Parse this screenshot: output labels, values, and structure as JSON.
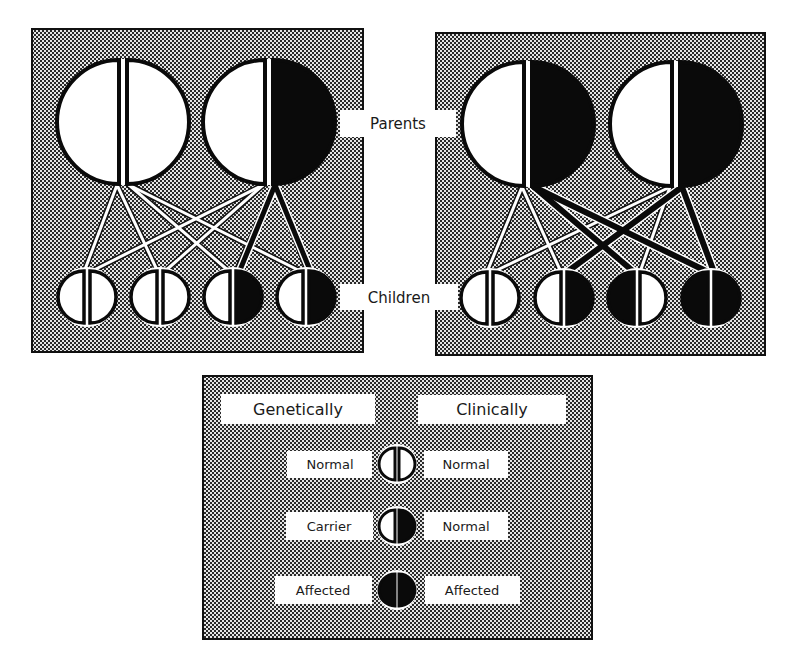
{
  "figure": {
    "title": "",
    "labels": {
      "parents": "Parents",
      "children": "Children"
    },
    "colors": {
      "background": "#ffffff",
      "panel_dot": "#1a1a1a",
      "panel_light": "#e8e8e8",
      "affected": "#0a0a0a",
      "normal": "#ffffff",
      "outline": "#0a0a0a"
    }
  },
  "panels": [
    {
      "id": "left-cross",
      "description": "Normal parent x Carrier parent",
      "parents": [
        {
          "left": "normal",
          "right": "normal",
          "label": "Normal"
        },
        {
          "left": "normal",
          "right": "affected",
          "label": "Carrier"
        }
      ],
      "children": [
        {
          "left": "normal",
          "right": "normal",
          "label": "Normal"
        },
        {
          "left": "normal",
          "right": "normal",
          "label": "Normal"
        },
        {
          "left": "normal",
          "right": "affected",
          "label": "Carrier"
        },
        {
          "left": "normal",
          "right": "affected",
          "label": "Carrier"
        }
      ]
    },
    {
      "id": "right-cross",
      "description": "Carrier parent x Carrier parent",
      "parents": [
        {
          "left": "normal",
          "right": "affected",
          "label": "Carrier"
        },
        {
          "left": "normal",
          "right": "affected",
          "label": "Carrier"
        }
      ],
      "children": [
        {
          "left": "normal",
          "right": "normal",
          "label": "Normal"
        },
        {
          "left": "normal",
          "right": "affected",
          "label": "Carrier"
        },
        {
          "left": "affected",
          "right": "normal",
          "label": "Carrier"
        },
        {
          "left": "affected",
          "right": "affected",
          "label": "Affected"
        }
      ]
    }
  ],
  "legend": {
    "headers": {
      "genetically": "Genetically",
      "clinically": "Clinically"
    },
    "rows": [
      {
        "genetic": "Normal",
        "clinical": "Normal",
        "left": "normal",
        "right": "normal"
      },
      {
        "genetic": "Carrier",
        "clinical": "Normal",
        "left": "normal",
        "right": "affected"
      },
      {
        "genetic": "Affected",
        "clinical": "Affected",
        "left": "affected",
        "right": "affected"
      }
    ]
  }
}
